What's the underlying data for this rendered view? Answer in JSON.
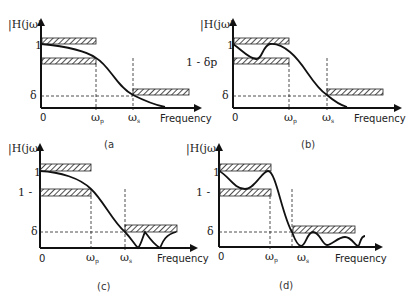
{
  "figure": {
    "panels": [
      {
        "id": "a",
        "caption": "(a",
        "ylabel": "|H(jω'",
        "xlabel": "Frequency",
        "origin": "0",
        "one_label": "1",
        "passband_low_label": "",
        "delta_label": "δ",
        "omega_p": "ω",
        "omega_p_sub": "p",
        "omega_s": "ω",
        "omega_s_sub": "s",
        "response": "monotonic"
      },
      {
        "id": "b",
        "caption": "(b)",
        "ylabel": "|H(jω'",
        "xlabel": "Frequency",
        "origin": "0",
        "one_label": "1",
        "passband_low_label": "1 - δp",
        "delta_label": "δ",
        "omega_p": "ω",
        "omega_p_sub": "p",
        "omega_s": "ω",
        "omega_s_sub": "s",
        "response": "passband-ripple"
      },
      {
        "id": "c",
        "caption": "(c)",
        "ylabel": "|H(jω",
        "xlabel": "Frequency",
        "origin": "0",
        "one_label": "1",
        "passband_low_label": "1 -",
        "delta_label": "δ",
        "omega_p": "ω",
        "omega_p_sub": "p",
        "omega_s": "ω",
        "omega_s_sub": "s",
        "response": "stopband-ripple"
      },
      {
        "id": "d",
        "caption": "(d)",
        "ylabel": "|H(jω",
        "xlabel": "Frequency",
        "origin": "0",
        "one_label": "1",
        "passband_low_label": "1 -",
        "delta_label": "δ",
        "omega_p": "ω",
        "omega_p_sub": "p",
        "omega_s": "ω",
        "omega_s_sub": "s",
        "response": "equiripple"
      }
    ],
    "colors": {
      "ink": "#111111",
      "hatch": "#333333"
    }
  }
}
